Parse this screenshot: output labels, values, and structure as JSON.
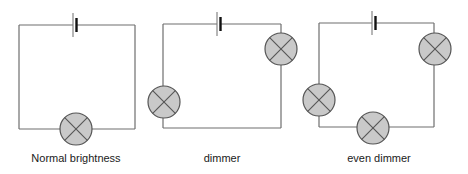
{
  "diagram": {
    "colors": {
      "wire": "#6e6e6e",
      "lamp_fill": "#c9c9c9",
      "lamp_outline": "#555555",
      "text": "#1a1a1a",
      "background": "#ffffff"
    },
    "circuits": [
      {
        "id": "circuit-1",
        "label": "Normal brightness",
        "lamp_count": 1,
        "cell_count": 1
      },
      {
        "id": "circuit-2",
        "label": "dimmer",
        "lamp_count": 2,
        "cell_count": 1
      },
      {
        "id": "circuit-3",
        "label": "even dimmer",
        "lamp_count": 3,
        "cell_count": 1
      }
    ]
  }
}
